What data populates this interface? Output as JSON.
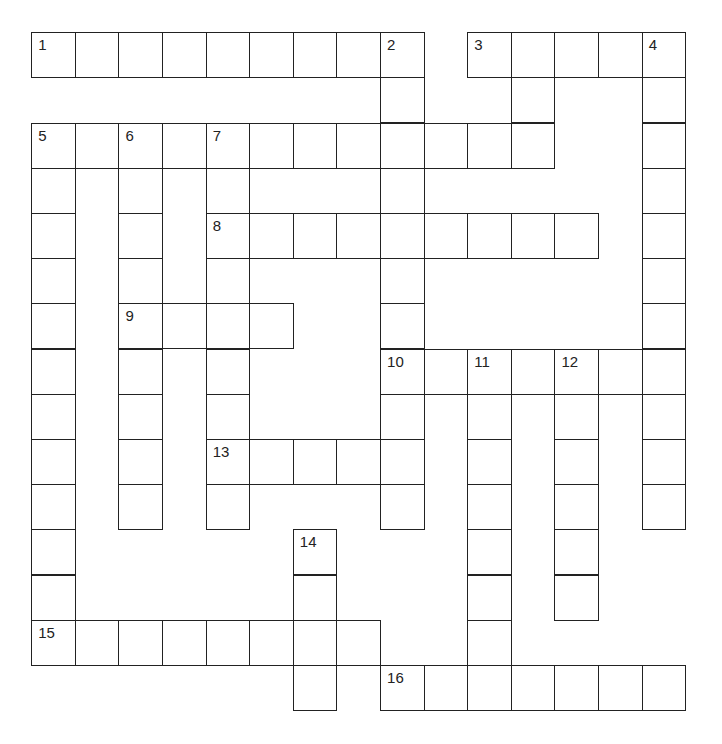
{
  "puzzle": {
    "columns": 15,
    "rows": 15,
    "entries": [
      {
        "number": "1",
        "direction": "across",
        "row": 0,
        "col": 0,
        "length": 9
      },
      {
        "number": "2",
        "direction": "down",
        "row": 0,
        "col": 8,
        "length": 11
      },
      {
        "number": "3",
        "direction": "across",
        "row": 0,
        "col": 10,
        "length": 5
      },
      {
        "number": "3",
        "direction": "down",
        "row": 0,
        "col": 10,
        "length": 0
      },
      {
        "number": "4",
        "direction": "down",
        "row": 0,
        "col": 14,
        "length": 11
      },
      {
        "number": "5",
        "direction": "across",
        "row": 2,
        "col": 0,
        "length": 12
      },
      {
        "number": "5",
        "direction": "down",
        "row": 2,
        "col": 0,
        "length": 12
      },
      {
        "number": "6",
        "direction": "down",
        "row": 2,
        "col": 2,
        "length": 9
      },
      {
        "number": "7",
        "direction": "down",
        "row": 2,
        "col": 4,
        "length": 9
      },
      {
        "number": "8",
        "direction": "across",
        "row": 4,
        "col": 4,
        "length": 9
      },
      {
        "number": "9",
        "direction": "across",
        "row": 6,
        "col": 2,
        "length": 4
      },
      {
        "number": "10",
        "direction": "across",
        "row": 7,
        "col": 8,
        "length": 7
      },
      {
        "number": "11",
        "direction": "down",
        "row": 7,
        "col": 10,
        "length": 7
      },
      {
        "number": "12",
        "direction": "down",
        "row": 7,
        "col": 12,
        "length": 6
      },
      {
        "number": "13",
        "direction": "across",
        "row": 9,
        "col": 4,
        "length": 5
      },
      {
        "number": "14",
        "direction": "down",
        "row": 11,
        "col": 6,
        "length": 4
      },
      {
        "number": "15",
        "direction": "across",
        "row": 13,
        "col": 0,
        "length": 8
      },
      {
        "number": "16",
        "direction": "across",
        "row": 14,
        "col": 8,
        "length": 7
      }
    ],
    "extra_cells": [
      {
        "row": 1,
        "col": 11
      },
      {
        "row": 2,
        "col": 11
      }
    ]
  }
}
